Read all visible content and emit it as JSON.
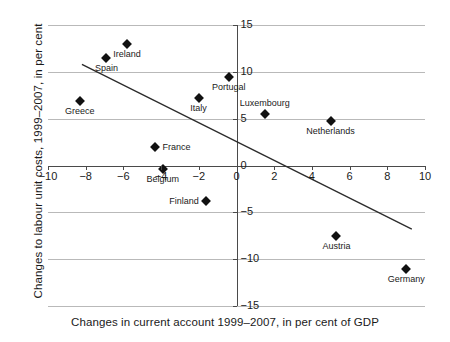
{
  "chart_data": {
    "type": "scatter",
    "title": "",
    "xlabel": "Changes in current account 1999–2007, in per cent of GDP",
    "ylabel": "Changes to labour unit costs, 1999–2007, in per cent",
    "xlim": [
      -10,
      10
    ],
    "ylim": [
      -15,
      15
    ],
    "xticks": [
      -10,
      -8,
      -6,
      -4,
      -2,
      0,
      2,
      4,
      6,
      8,
      10
    ],
    "xtick_labels": [
      "−10",
      "−8",
      "−6",
      "−4",
      "−2",
      "0",
      "2",
      "4",
      "6",
      "8",
      "10"
    ],
    "yticks": [
      -15,
      -10,
      -5,
      0,
      5,
      10,
      15
    ],
    "ytick_labels": [
      "−15",
      "−10",
      "−5",
      "0",
      "5",
      "10",
      "15"
    ],
    "grid": "horizontal",
    "legend": "none",
    "points": [
      {
        "label": "Greece",
        "x": -8.3,
        "y": 6.9,
        "label_pos": "below"
      },
      {
        "label": "Spain",
        "x": -6.9,
        "y": 11.5,
        "label_pos": "below"
      },
      {
        "label": "Ireland",
        "x": -5.8,
        "y": 13.0,
        "label_pos": "below"
      },
      {
        "label": "Italy",
        "x": -2.0,
        "y": 7.2,
        "label_pos": "below"
      },
      {
        "label": "Portugal",
        "x": -0.4,
        "y": 9.5,
        "label_pos": "below"
      },
      {
        "label": "Luxembourg",
        "x": 1.5,
        "y": 5.5,
        "label_pos": "above"
      },
      {
        "label": "Netherlands",
        "x": 5.0,
        "y": 4.8,
        "label_pos": "below"
      },
      {
        "label": "France",
        "x": -4.3,
        "y": 2.0,
        "label_pos": "right"
      },
      {
        "label": "Belgium",
        "x": -3.9,
        "y": -0.4,
        "label_pos": "below"
      },
      {
        "label": "Finland",
        "x": -1.6,
        "y": -3.8,
        "label_pos": "left"
      },
      {
        "label": "Austria",
        "x": 5.3,
        "y": -7.5,
        "label_pos": "below"
      },
      {
        "label": "Germany",
        "x": 9.0,
        "y": -11.0,
        "label_pos": "below"
      }
    ],
    "trendline": {
      "x0": -8.2,
      "y0": 10.8,
      "x1": 9.3,
      "y1": -6.8
    },
    "colors": {
      "marker": "#111111",
      "grid": "#b9b9b9",
      "axis": "#4a4a4a",
      "trend": "#2b2b2b"
    }
  }
}
